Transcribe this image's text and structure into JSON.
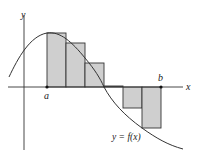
{
  "labels": {
    "y_axis": "y",
    "x_axis": "x",
    "a": "a",
    "b": "b",
    "curve": "y = f(x)"
  },
  "colors": {
    "rect_fill": "#cfcfcf",
    "stroke": "#333333",
    "background": "#ffffff"
  },
  "diagram": {
    "type": "riemann_sum",
    "num_rectangles": 6,
    "rectangles": [
      {
        "index": 1,
        "sign": "positive",
        "relative_height": 1.0
      },
      {
        "index": 2,
        "sign": "positive",
        "relative_height": 0.81
      },
      {
        "index": 3,
        "sign": "positive",
        "relative_height": 0.44
      },
      {
        "index": 4,
        "sign": "zero",
        "relative_height": 0.0
      },
      {
        "index": 5,
        "sign": "negative",
        "relative_height": -0.39
      },
      {
        "index": 6,
        "sign": "negative",
        "relative_height": -0.76
      }
    ]
  }
}
